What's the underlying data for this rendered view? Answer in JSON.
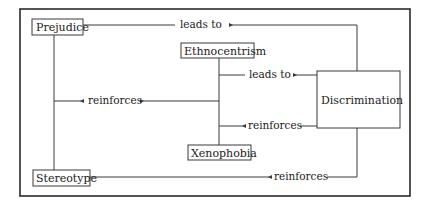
{
  "diagram": {
    "type": "concept-map",
    "nodes": {
      "prejudice": "Prejudice",
      "ethnocentrism": "Ethnocentrism",
      "discrimination": "Discrimination",
      "xenophobia": "Xenophobia",
      "stereotype": "Stereotype"
    },
    "edges": {
      "prejudice_to_discrimination": {
        "from": "Prejudice",
        "to": "Discrimination",
        "label": "leads to"
      },
      "ethno_xeno_to_discrimination": {
        "from": "Ethnocentrism / Xenophobia",
        "to": "Discrimination",
        "label": "leads to"
      },
      "prejudice_stereotype_ethno_xeno": {
        "from": "Prejudice / Stereotype",
        "to": "Ethnocentrism / Xenophobia",
        "label": "reinforces",
        "bidirectional": true
      },
      "discrimination_to_ethno_xeno": {
        "from": "Discrimination",
        "to": "Ethnocentrism / Xenophobia",
        "label": "reinforces"
      },
      "discrimination_to_stereotype": {
        "from": "Discrimination",
        "to": "Stereotype",
        "label": "reinforces"
      }
    },
    "colors": {
      "line": "#3a3a3a",
      "text": "#1a1a1a",
      "background": "#ffffff"
    }
  }
}
